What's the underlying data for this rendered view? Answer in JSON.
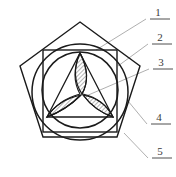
{
  "figure": {
    "background_color": "#ffffff",
    "stroke_color": "#1a1a1a",
    "leader_color": "#9a9a9a",
    "hatch_color": "#2b2b2b",
    "label_color": "#3a3a3a"
  },
  "callouts": [
    {
      "id": "1",
      "label": "1",
      "text_x": 158,
      "text_y": 16,
      "underline_x1": 150,
      "underline_x2": 170,
      "underline_y": 19,
      "leader": "96,50 146,19"
    },
    {
      "id": "2",
      "label": "2",
      "text_x": 160,
      "text_y": 41,
      "underline_x1": 152,
      "underline_x2": 172,
      "underline_y": 44,
      "leader": "118,66 148,44"
    },
    {
      "id": "3",
      "label": "3",
      "text_x": 161,
      "text_y": 66,
      "underline_x1": 153,
      "underline_x2": 173,
      "underline_y": 69,
      "leader": "86,96 149,69"
    },
    {
      "id": "4",
      "label": "4",
      "text_x": 159,
      "text_y": 121,
      "underline_x1": 151,
      "underline_x2": 171,
      "underline_y": 124,
      "leader": "128,101 147,124"
    },
    {
      "id": "5",
      "label": "5",
      "text_x": 160,
      "text_y": 155,
      "underline_x1": 152,
      "underline_x2": 172,
      "underline_y": 158,
      "leader": "124,133 148,158"
    }
  ],
  "shapes": {
    "pentagon": {
      "name": "outer-pentagon",
      "points": "80,22 140,66 117,137 43,137 20,66"
    },
    "outer_circle": {
      "name": "outer-circle",
      "cx": 80,
      "cy": 92,
      "r": 48
    },
    "square": {
      "name": "inscribed-square",
      "x": 43,
      "y": 50,
      "width": 74,
      "height": 82
    },
    "inner_circle": {
      "name": "inner-circle",
      "cx": 80,
      "cy": 90,
      "r": 38
    },
    "triangle": {
      "name": "inscribed-triangle",
      "points": "80,53 113,117 47,117"
    },
    "petals": [
      {
        "name": "petal-top",
        "path": "M 80,53 Q 92,76 82,94 Q 70,76 80,53 Z"
      },
      {
        "name": "petal-bottom-right",
        "path": "M 113,117 Q 95,111 83,95 Q 104,99 113,117 Z"
      },
      {
        "name": "petal-bottom-left",
        "path": "M 47,117 Q 66,110 81,95 Q 58,100 47,117 Z"
      }
    ],
    "arcs": [
      {
        "name": "arc-top-to-bottom-right",
        "path": "M 80,53 Q 92,76 82,94"
      },
      {
        "name": "arc-top-to-bottom-left",
        "path": "M 80,53 Q 70,76 80,94"
      },
      {
        "name": "arc-right-inner",
        "path": "M 113,117 Q 95,111 83,95"
      },
      {
        "name": "arc-right-outer",
        "path": "M 113,117 Q 104,99 83,94"
      },
      {
        "name": "arc-left-inner",
        "path": "M 47,117 Q 66,110 81,95"
      },
      {
        "name": "arc-left-outer",
        "path": "M 47,117 Q 58,100 80,94"
      }
    ]
  },
  "hatching": {
    "pattern_name": "diagonal-hatch",
    "spacing": 3,
    "angle_deg": 45,
    "line_width": 0.7
  }
}
